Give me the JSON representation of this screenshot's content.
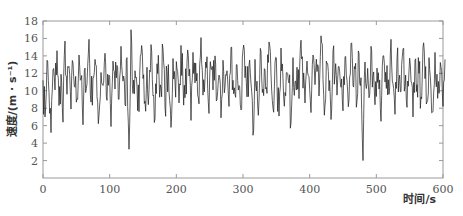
{
  "chart_data": {
    "type": "line",
    "title": "",
    "xlabel": "时间/s",
    "ylabel": "速度/(m · s⁻¹)",
    "xlim": [
      0,
      600
    ],
    "ylim": [
      0,
      18
    ],
    "x_ticks": [
      0,
      100,
      200,
      300,
      400,
      500,
      600
    ],
    "y_ticks": [
      2,
      4,
      6,
      8,
      10,
      12,
      14,
      16,
      18
    ],
    "grid": false,
    "legend": null,
    "line_color": "#1a1a1a",
    "x_step": 3,
    "series": [
      {
        "name": "speed",
        "x_start": 0,
        "x_step": 3,
        "values": [
          11.2,
          7.0,
          13.5,
          9.8,
          5.2,
          12.4,
          10.1,
          14.6,
          8.3,
          11.9,
          6.4,
          15.7,
          9.6,
          12.8,
          7.9,
          13.2,
          10.4,
          9.1,
          14.1,
          11.3,
          6.1,
          12.6,
          10.8,
          15.9,
          8.7,
          11.5,
          13.6,
          9.3,
          7.2,
          12.1,
          10.6,
          14.3,
          8.9,
          11.8,
          5.9,
          13.4,
          10.2,
          12.9,
          9.0,
          15.1,
          11.1,
          8.4,
          13.8,
          3.3,
          17.0,
          9.7,
          12.3,
          10.5,
          7.6,
          14.2,
          11.4,
          8.8,
          12.7,
          10.0,
          15.3,
          9.4,
          6.8,
          13.1,
          11.6,
          10.3,
          14.8,
          8.1,
          12.2,
          9.9,
          5.8,
          13.7,
          11.0,
          12.5,
          8.6,
          15.2,
          10.7,
          9.2,
          13.3,
          11.7,
          6.6,
          14.4,
          10.9,
          12.0,
          8.5,
          16.1,
          9.5,
          11.3,
          13.9,
          7.4,
          12.6,
          10.1,
          14.0,
          9.0,
          11.8,
          6.9,
          13.5,
          10.4,
          12.3,
          8.2,
          15.0,
          11.2,
          9.6,
          13.0,
          10.6,
          7.8,
          14.7,
          11.5,
          9.3,
          12.9,
          10.8,
          4.9,
          13.6,
          11.1,
          8.9,
          14.5,
          10.2,
          12.4,
          9.7,
          15.6,
          11.9,
          8.0,
          13.2,
          10.5,
          7.1,
          14.9,
          11.4,
          9.8,
          12.1,
          10.9,
          6.3,
          13.8,
          11.0,
          12.7,
          9.1,
          15.8,
          10.3,
          8.6,
          13.4,
          11.6,
          7.5,
          14.1,
          10.7,
          12.2,
          9.4,
          16.3,
          11.3,
          8.3,
          13.1,
          10.0,
          6.7,
          14.6,
          11.8,
          9.5,
          12.8,
          10.4,
          7.7,
          13.9,
          11.2,
          9.0,
          15.4,
          10.6,
          12.5,
          8.8,
          14.3,
          11.5,
          2.0,
          13.3,
          10.9,
          9.2,
          15.1,
          11.7,
          8.4,
          12.6,
          10.2,
          6.5,
          14.0,
          11.0,
          12.9,
          9.6,
          15.9,
          10.8,
          7.3,
          13.7,
          11.3,
          9.9,
          14.8,
          10.5,
          8.1,
          12.3,
          11.1,
          7.0,
          13.5,
          10.7,
          12.0,
          9.3,
          15.0,
          11.4,
          8.7,
          13.8,
          10.1,
          7.6,
          14.4,
          11.9,
          9.7,
          12.7,
          8.2,
          13.6
        ]
      }
    ]
  },
  "plot": {
    "x_tick_labels": [
      "0",
      "100",
      "200",
      "300",
      "400",
      "500",
      "600"
    ],
    "y_tick_labels": [
      "2",
      "4",
      "6",
      "8",
      "10",
      "12",
      "14",
      "16",
      "18"
    ],
    "xlabel": "时间/s",
    "ylabel": "速度/(m · s⁻¹)"
  }
}
